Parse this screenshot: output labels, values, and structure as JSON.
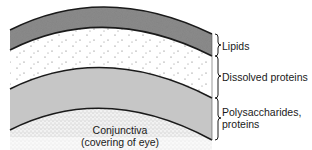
{
  "diagram": {
    "layers": [
      {
        "id": "lipids",
        "label": "Lipids",
        "fill": "#8a8a8a"
      },
      {
        "id": "dissolved-proteins",
        "label": "Dissolved proteins",
        "fill": "#ffffff"
      },
      {
        "id": "polysaccharides",
        "label": "Polysaccharides,",
        "label_line2": "proteins",
        "fill": "#c4c4c4"
      },
      {
        "id": "conjunctiva",
        "label": "Conjunctiva",
        "label_line2": "(covering of eye)",
        "fill": "#e6e6e6"
      }
    ],
    "colors": {
      "outline": "#1a1a1a",
      "lipids_fill": "#8a8a8a",
      "dissolved_fill": "#ffffff",
      "polysaccharides_fill": "#c4c4c4",
      "conjunctiva_fill": "#ececec",
      "dots": "#555555"
    }
  }
}
